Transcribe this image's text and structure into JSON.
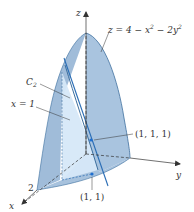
{
  "figure": {
    "surface_equation": {
      "prefix": "z = 4 − x",
      "exp1": "2",
      "middle": " − 2y",
      "exp2": "2"
    },
    "labels": {
      "z_axis": "z",
      "x_axis": "x",
      "y_axis": "y",
      "curve": "C",
      "curve_sub": "2",
      "plane": "x = 1",
      "point3d": "(1, 1, 1)",
      "point2d": "(1, 1)",
      "x_intercept": "2"
    },
    "colors": {
      "surface_fill": "#a9c4df",
      "surface_dark": "#8fb0d2",
      "plane_fill": "#d6e8f8",
      "edge": "#3d6f9e",
      "tangent_line": "#2a6db5",
      "point": "#1f6fd0",
      "axis": "#333333"
    }
  }
}
